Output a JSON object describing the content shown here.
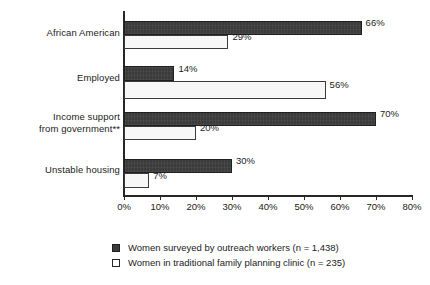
{
  "chart_data": {
    "type": "bar",
    "orientation": "horizontal",
    "title": "",
    "xlabel": "",
    "ylabel": "",
    "xlim": [
      0,
      80
    ],
    "xtick_labels": [
      "0%",
      "10%",
      "20%",
      "30%",
      "40%",
      "50%",
      "60%",
      "70%",
      "80%"
    ],
    "xticks": [
      0,
      10,
      20,
      30,
      40,
      50,
      60,
      70,
      80
    ],
    "grid": false,
    "legend_position": "bottom",
    "categories": [
      "African American",
      "Employed",
      "Income support\nfrom government**",
      "Unstable housing"
    ],
    "series": [
      {
        "name": "Women surveyed by outreach workers (n = 1,438)",
        "color": "#3b3b3b",
        "values": [
          66,
          14,
          70,
          30
        ],
        "value_labels": [
          "66%",
          "14%",
          "70%",
          "30%"
        ]
      },
      {
        "name": "Women in traditional family planning clinic (n = 235)",
        "color": "#f7f7f7",
        "values": [
          29,
          56,
          20,
          7
        ],
        "value_labels": [
          "29%",
          "56%",
          "20%",
          "7%"
        ]
      }
    ]
  },
  "legend": {
    "items": [
      {
        "label": "Women surveyed by outreach workers (n = 1,438)",
        "swatch": "dark"
      },
      {
        "label": "Women in traditional family planning clinic (n = 235)",
        "swatch": "light"
      }
    ]
  }
}
